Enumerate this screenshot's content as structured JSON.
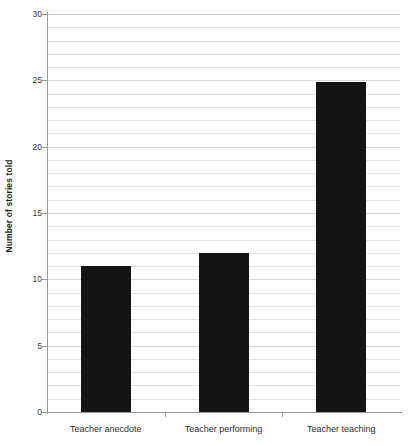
{
  "chart_data": {
    "type": "bar",
    "title": "",
    "subtitle": "",
    "xlabel": "",
    "ylabel": "Number of stories told",
    "categories": [
      "Teacher anecdote",
      "Teacher performing",
      "Teacher teaching"
    ],
    "values": [
      11,
      12,
      24.9
    ],
    "series": [
      {
        "name": "Number of stories told",
        "values": [
          11,
          12,
          24.9
        ]
      }
    ],
    "ylim": [
      0,
      30
    ],
    "y_ticks": [
      0,
      5,
      10,
      15,
      20,
      25,
      30
    ],
    "y_tick_labels": [
      "0",
      "5",
      "10",
      "15",
      "20",
      "25",
      "30"
    ],
    "minor_tick_step": 1,
    "grid": true,
    "grid_axis": "y",
    "legend": false,
    "legend_position": "none",
    "bar_color": "#141414",
    "gridline_color": "#e3e3e3",
    "axis_color": "#9a9a9a",
    "text_color": "#2e2e2e",
    "background_color": "#ffffff",
    "annotations": []
  },
  "axes": {
    "y_title": "Number of stories told"
  }
}
